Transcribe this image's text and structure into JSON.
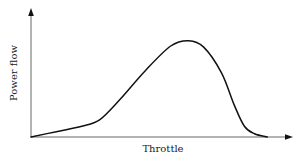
{
  "chart_data": {
    "type": "line",
    "title": "",
    "xlabel": "Throttle",
    "ylabel": "Power flow",
    "grid": false,
    "legend": null,
    "x_ticks": [],
    "y_ticks": [],
    "xlim": [
      0,
      1
    ],
    "ylim": [
      0,
      1
    ],
    "series": [
      {
        "name": "Power flow vs throttle",
        "x": [
          0.0,
          0.1,
          0.2,
          0.27,
          0.35,
          0.45,
          0.55,
          0.62,
          0.68,
          0.75,
          0.8,
          0.84,
          0.88,
          0.93
        ],
        "y": [
          0.0,
          0.05,
          0.1,
          0.16,
          0.35,
          0.62,
          0.85,
          0.9,
          0.84,
          0.6,
          0.3,
          0.1,
          0.03,
          0.0
        ]
      }
    ],
    "annotations": []
  },
  "colors": {
    "curve": "#111111",
    "axis": "#444444",
    "background": "#ffffff"
  }
}
